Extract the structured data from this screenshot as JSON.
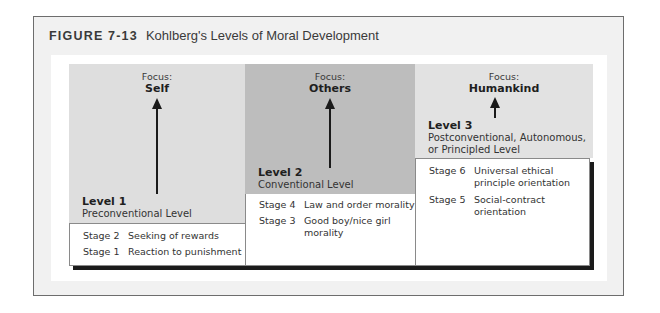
{
  "figure": {
    "label": "FIGURE 7-13",
    "caption": "Kohlberg's Levels of Moral Development"
  },
  "levels": [
    {
      "focus_label": "Focus:",
      "focus": "Self",
      "level": "Level 1",
      "name": "Preconventional Level",
      "stages": [
        {
          "stage": "Stage 2",
          "desc": "Seeking of rewards"
        },
        {
          "stage": "Stage 1",
          "desc": "Reaction to punishment"
        }
      ]
    },
    {
      "focus_label": "Focus:",
      "focus": "Others",
      "level": "Level 2",
      "name": "Conventional Level",
      "stages": [
        {
          "stage": "Stage 4",
          "desc": "Law and order morality"
        },
        {
          "stage": "Stage 3",
          "desc": "Good boy/nice girl morality"
        }
      ]
    },
    {
      "focus_label": "Focus:",
      "focus": "Humankind",
      "level": "Level 3",
      "name": "Postconventional, Autonomous, or Principled Level",
      "stages": [
        {
          "stage": "Stage 6",
          "desc": "Universal ethical principle orientation"
        },
        {
          "stage": "Stage 5",
          "desc": "Social-contract orientation"
        }
      ]
    }
  ],
  "colors": {
    "level1_fill": "#dedede",
    "level2_fill": "#bdbdbd",
    "level3_fill": "#e2e2e2",
    "shadow": "#1b1b1b"
  }
}
